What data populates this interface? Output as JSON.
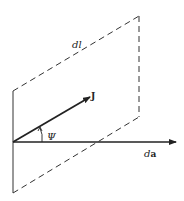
{
  "diagram": {
    "labels": {
      "dl": "dl",
      "J": "J",
      "psi": "Ψ",
      "da_d": "d",
      "da_a": "a"
    },
    "colors": {
      "stroke": "#222222",
      "background": "#ffffff"
    }
  }
}
